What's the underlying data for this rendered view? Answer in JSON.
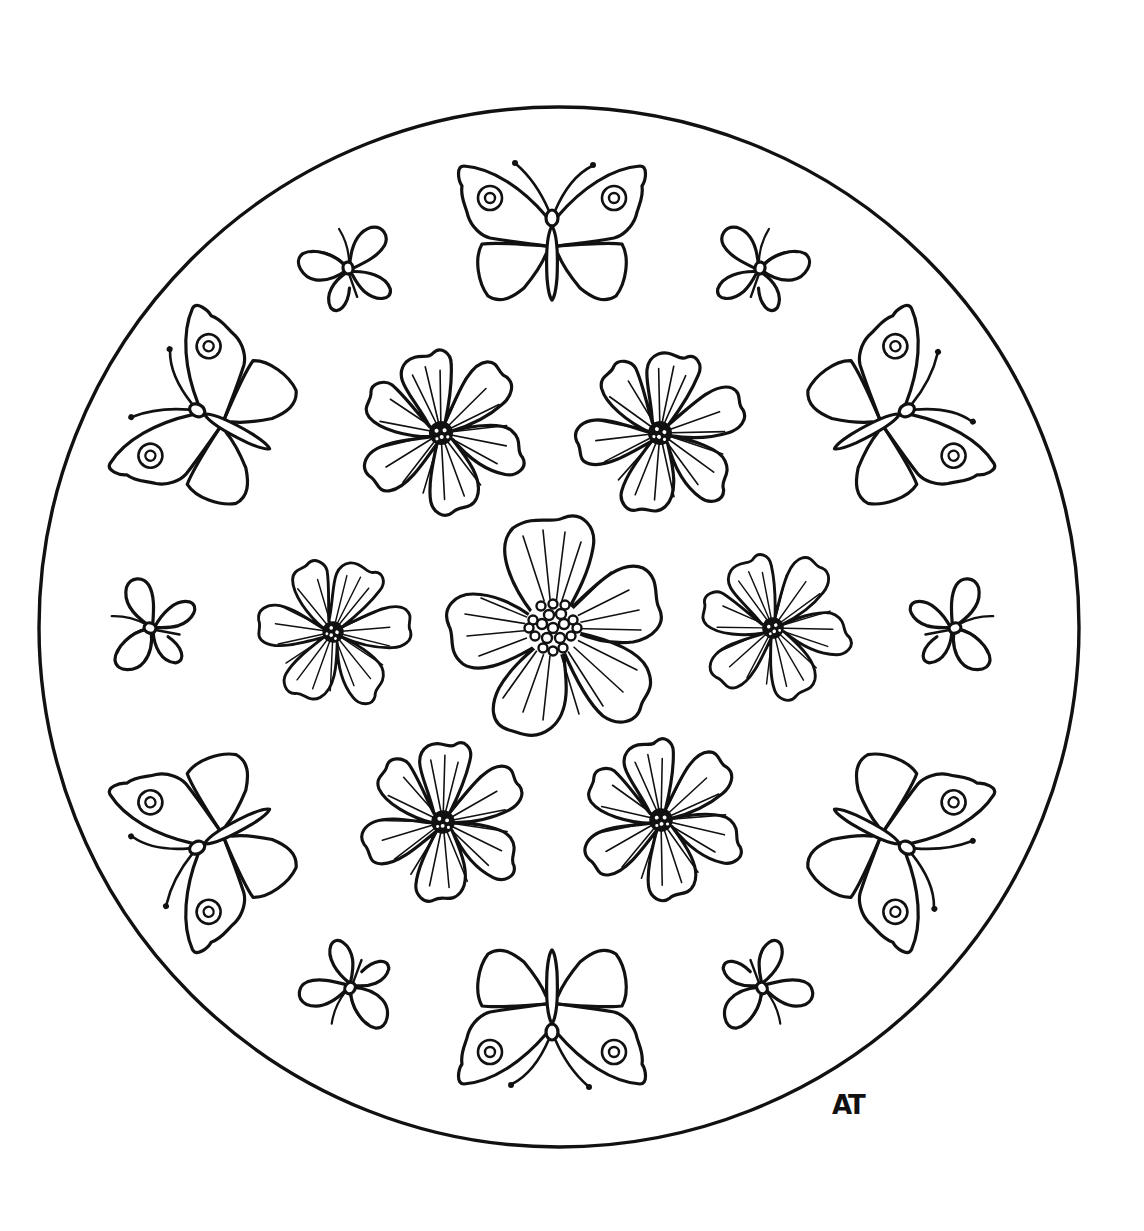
{
  "artwork": {
    "type": "mandala coloring page",
    "background": "#ffffff",
    "line_color": "#111111",
    "signature": "AT",
    "circle": {
      "cx": 559,
      "cy": 627,
      "r": 520
    }
  },
  "center_flower": {
    "cx": 553,
    "cy": 628,
    "r": 110,
    "petals": 5
  },
  "ruffled_flowers": [
    {
      "cx": 441,
      "cy": 433,
      "r": 80
    },
    {
      "cx": 660,
      "cy": 433,
      "r": 80
    },
    {
      "cx": 333,
      "cy": 632,
      "r": 70
    },
    {
      "cx": 773,
      "cy": 628,
      "r": 70
    },
    {
      "cx": 443,
      "cy": 822,
      "r": 78
    },
    {
      "cx": 661,
      "cy": 820,
      "r": 78
    }
  ],
  "large_butterflies": [
    {
      "x": 552,
      "y": 228,
      "rot": 0,
      "scale": 1
    },
    {
      "x": 206,
      "y": 415,
      "rot": -62,
      "scale": 1
    },
    {
      "x": 898,
      "y": 415,
      "rot": 62,
      "scale": 1
    },
    {
      "x": 206,
      "y": 843,
      "rot": -118,
      "scale": 1
    },
    {
      "x": 898,
      "y": 843,
      "rot": 118,
      "scale": 1
    },
    {
      "x": 552,
      "y": 1022,
      "rot": 180,
      "scale": 1
    }
  ],
  "small_butterflies": [
    {
      "x": 348,
      "y": 268,
      "rot": -40
    },
    {
      "x": 760,
      "y": 268,
      "rot": 40
    },
    {
      "x": 150,
      "y": 628,
      "rot": -90
    },
    {
      "x": 955,
      "y": 628,
      "rot": 90
    },
    {
      "x": 350,
      "y": 988,
      "rot": -140
    },
    {
      "x": 762,
      "y": 988,
      "rot": 140
    }
  ]
}
